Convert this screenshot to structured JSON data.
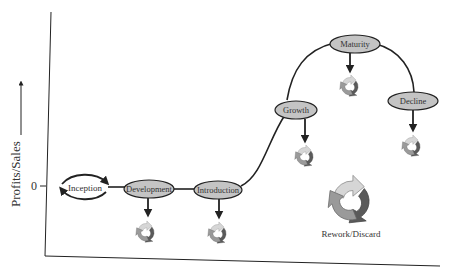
{
  "axis": {
    "y_label": "Profits/Sales",
    "zero_tick": "0"
  },
  "stages": [
    {
      "id": "inception",
      "label": "Inception",
      "filled": false,
      "rework": false
    },
    {
      "id": "development",
      "label": "Development",
      "filled": true,
      "rework": true
    },
    {
      "id": "introduction",
      "label": "Introduction",
      "filled": true,
      "rework": true
    },
    {
      "id": "growth",
      "label": "Growth",
      "filled": true,
      "rework": true
    },
    {
      "id": "maturity",
      "label": "Maturity",
      "filled": true,
      "rework": true
    },
    {
      "id": "decline",
      "label": "Decline",
      "filled": true,
      "rework": true
    }
  ],
  "legend": {
    "rework_label": "Rework/Discard",
    "icon": "recycle-arrows-icon"
  },
  "colors": {
    "node_fill": "#c4c4c4",
    "line": "#222222",
    "recycle_light": "#d6d6d6",
    "recycle_mid": "#9a9a9a",
    "recycle_dark": "#5a5a5a"
  }
}
